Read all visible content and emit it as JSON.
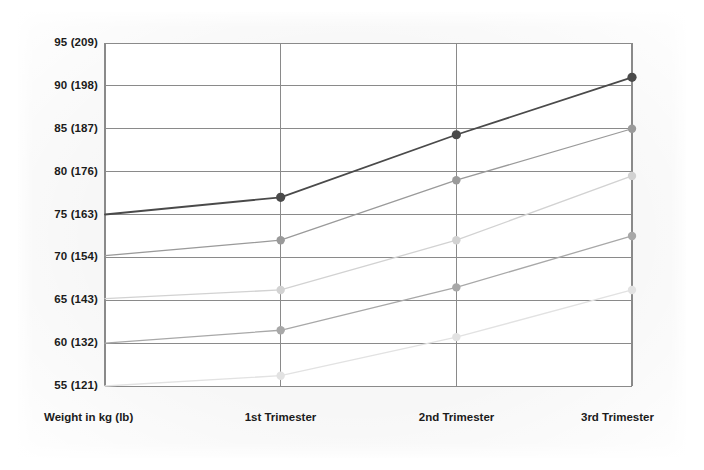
{
  "chart_data": {
    "type": "line",
    "title": "",
    "xlabel": "",
    "ylabel": "",
    "grid": true,
    "legend_position": "none",
    "categories": [
      "Weight in kg (lb)",
      "1st Trimester",
      "2nd Trimester",
      "3rd Trimester"
    ],
    "x_tick_labels": [
      "Weight in kg (lb)",
      "1st Trimester",
      "2nd Trimester",
      "3rd Trimester"
    ],
    "y_tick_labels": [
      "95 (209)",
      "90 (198)",
      "85 (187)",
      "80 (176)",
      "75 (163)",
      "70 (154)",
      "65 (143)",
      "60 (132)",
      "55 (121)"
    ],
    "y_tick_values": [
      95,
      90,
      85,
      80,
      75,
      70,
      65,
      60,
      55
    ],
    "ylim": [
      55,
      95
    ],
    "units": "kg (lb)",
    "series": [
      {
        "name": "Start 75 kg (163 lb)",
        "color": "#4a4a4a",
        "marker": true,
        "values": [
          75.0,
          77.0,
          84.3,
          91.0
        ]
      },
      {
        "name": "Start 70 kg (154 lb)",
        "color": "#9a9a9a",
        "marker": true,
        "values": [
          70.2,
          72.0,
          79.0,
          85.0
        ]
      },
      {
        "name": "Start 65 kg (143 lb)",
        "color": "#d2d2d2",
        "marker": true,
        "values": [
          65.2,
          66.2,
          72.0,
          79.5
        ]
      },
      {
        "name": "Start 60 kg (132 lb)",
        "color": "#a8a8a8",
        "marker": true,
        "values": [
          60.0,
          61.5,
          66.5,
          72.5
        ]
      },
      {
        "name": "Start 55 kg (121 lb)",
        "color": "#e2e2e2",
        "marker": true,
        "values": [
          55.0,
          56.2,
          60.7,
          66.2
        ]
      }
    ],
    "axis_color": "#8a8a8a",
    "grid_color": "#8a8a8a",
    "plot_background": "#ffffff",
    "page_background": "#f7f7f7"
  }
}
